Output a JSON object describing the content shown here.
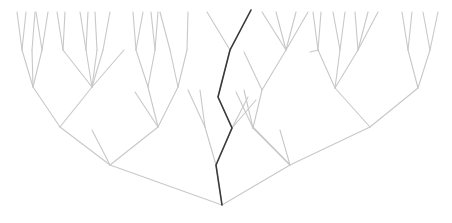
{
  "diagram": {
    "type": "tree",
    "root": [
      222,
      205
    ],
    "colors": {
      "edge": "#c8c8c8",
      "highlight": "#3a3a3a",
      "background": "#ffffff"
    },
    "highlight_path": [
      [
        222,
        205
      ],
      [
        216,
        165
      ],
      [
        232,
        128
      ],
      [
        218,
        97
      ],
      [
        230,
        50
      ],
      [
        251,
        10
      ]
    ],
    "edges": [
      [
        222,
        205,
        110,
        165
      ],
      [
        222,
        205,
        290,
        165
      ],
      [
        222,
        205,
        216,
        165
      ],
      [
        110,
        165,
        60,
        127
      ],
      [
        110,
        165,
        158,
        127
      ],
      [
        110,
        165,
        92,
        130
      ],
      [
        60,
        127,
        33,
        87
      ],
      [
        60,
        127,
        92,
        87
      ],
      [
        33,
        87,
        22,
        50
      ],
      [
        33,
        87,
        32,
        50
      ],
      [
        22,
        50,
        17,
        12
      ],
      [
        22,
        50,
        26,
        12
      ],
      [
        32,
        50,
        35,
        12
      ],
      [
        42,
        50,
        36,
        12
      ],
      [
        42,
        50,
        48,
        12
      ],
      [
        33,
        87,
        42,
        50
      ],
      [
        92,
        87,
        63,
        50
      ],
      [
        92,
        87,
        97,
        50
      ],
      [
        92,
        87,
        124,
        50
      ],
      [
        63,
        50,
        57,
        12
      ],
      [
        63,
        50,
        65,
        12
      ],
      [
        86,
        50,
        80,
        12
      ],
      [
        86,
        50,
        88,
        12
      ],
      [
        92,
        87,
        86,
        50
      ],
      [
        97,
        50,
        95,
        12
      ],
      [
        103,
        50,
        110,
        12
      ],
      [
        92,
        87,
        103,
        50
      ],
      [
        158,
        127,
        148,
        87
      ],
      [
        158,
        127,
        178,
        87
      ],
      [
        158,
        127,
        135,
        92
      ],
      [
        148,
        87,
        136,
        50
      ],
      [
        148,
        87,
        155,
        50
      ],
      [
        136,
        50,
        133,
        12
      ],
      [
        136,
        50,
        143,
        12
      ],
      [
        155,
        50,
        158,
        12
      ],
      [
        155,
        50,
        151,
        12
      ],
      [
        178,
        87,
        187,
        50
      ],
      [
        178,
        87,
        170,
        50
      ],
      [
        187,
        50,
        188,
        12
      ],
      [
        170,
        50,
        160,
        12
      ],
      [
        216,
        165,
        205,
        127
      ],
      [
        216,
        165,
        232,
        128
      ],
      [
        205,
        127,
        188,
        90
      ],
      [
        205,
        127,
        200,
        90
      ],
      [
        232,
        128,
        218,
        97
      ],
      [
        218,
        97,
        230,
        50
      ],
      [
        230,
        50,
        251,
        10
      ],
      [
        230,
        50,
        207,
        12
      ],
      [
        232,
        128,
        248,
        97
      ],
      [
        232,
        128,
        256,
        100
      ],
      [
        290,
        165,
        253,
        128
      ],
      [
        290,
        165,
        370,
        127
      ],
      [
        290,
        165,
        280,
        130
      ],
      [
        290,
        165,
        253,
        127
      ],
      [
        253,
        128,
        262,
        90
      ],
      [
        253,
        128,
        244,
        90
      ],
      [
        253,
        128,
        236,
        92
      ],
      [
        262,
        90,
        286,
        50
      ],
      [
        262,
        90,
        244,
        52
      ],
      [
        286,
        50,
        262,
        12
      ],
      [
        286,
        50,
        276,
        12
      ],
      [
        286,
        50,
        296,
        12
      ],
      [
        286,
        50,
        308,
        12
      ],
      [
        370,
        127,
        335,
        88
      ],
      [
        370,
        127,
        418,
        88
      ],
      [
        335,
        88,
        318,
        50
      ],
      [
        335,
        88,
        340,
        50
      ],
      [
        335,
        88,
        358,
        50
      ],
      [
        318,
        50,
        313,
        12
      ],
      [
        318,
        50,
        321,
        12
      ],
      [
        318,
        50,
        310,
        52
      ],
      [
        340,
        50,
        333,
        12
      ],
      [
        340,
        50,
        345,
        12
      ],
      [
        358,
        50,
        355,
        12
      ],
      [
        358,
        50,
        368,
        12
      ],
      [
        358,
        50,
        378,
        12
      ],
      [
        418,
        88,
        408,
        50
      ],
      [
        418,
        88,
        430,
        50
      ],
      [
        408,
        50,
        402,
        12
      ],
      [
        408,
        50,
        412,
        12
      ],
      [
        430,
        50,
        423,
        12
      ],
      [
        430,
        50,
        438,
        12
      ]
    ]
  }
}
